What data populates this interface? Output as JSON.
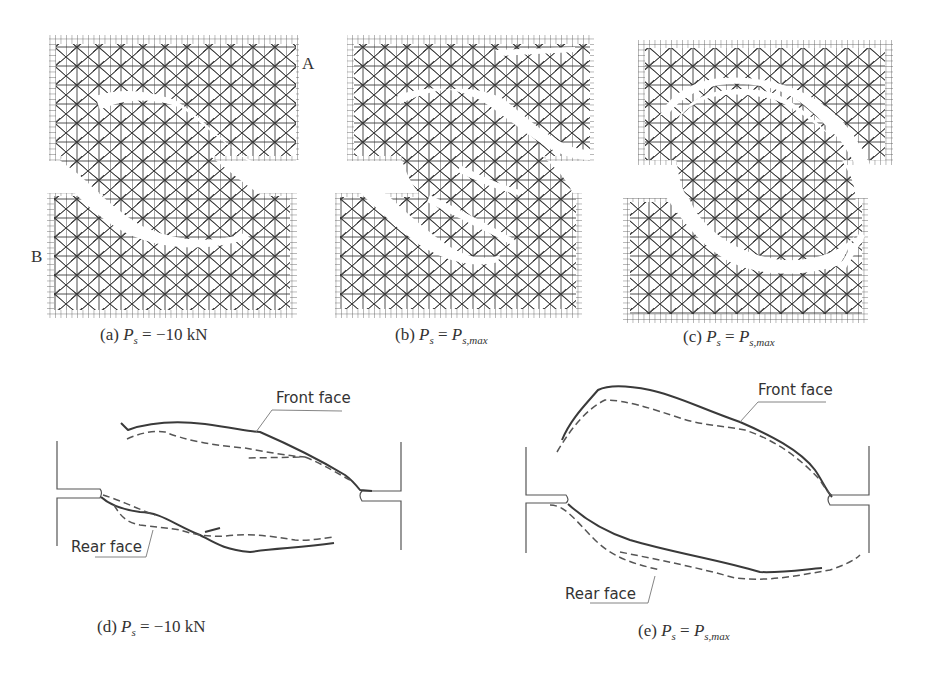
{
  "figure": {
    "type": "crack-pattern-comparison",
    "mesh_panels": [
      {
        "id": "a",
        "label_prefix": "(a)",
        "symbol": "P",
        "subscript": "s",
        "relation": "=",
        "value": "−10 kN",
        "value_sub": ""
      },
      {
        "id": "b",
        "label_prefix": "(b)",
        "symbol": "P",
        "subscript": "s",
        "relation": "=",
        "value": "P",
        "value_sub": "s,max"
      },
      {
        "id": "c",
        "label_prefix": "(c)",
        "symbol": "P",
        "subscript": "s",
        "relation": "=",
        "value": "P",
        "value_sub": "s,max"
      }
    ],
    "crack_panels": [
      {
        "id": "d",
        "label_prefix": "(d)",
        "symbol": "P",
        "subscript": "s",
        "relation": "=",
        "value": "−10 kN",
        "value_sub": "",
        "front_label": "Front face",
        "rear_label": "Rear face"
      },
      {
        "id": "e",
        "label_prefix": "(e)",
        "symbol": "P",
        "subscript": "s",
        "relation": "=",
        "value": "P",
        "value_sub": "s,max",
        "front_label": "Front face",
        "rear_label": "Rear face"
      }
    ],
    "point_labels": {
      "A": "A",
      "B": "B"
    },
    "legend": {
      "solid": "Front face (solid line)",
      "dashed": "Rear face (dashed line)"
    },
    "colors": {
      "mesh": "#3a3a3a",
      "grid": "#555555",
      "crack_line": "#444444",
      "frame": "#555555"
    }
  }
}
